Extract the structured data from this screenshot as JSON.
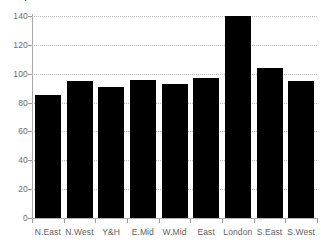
{
  "chart_data": {
    "type": "bar",
    "title": "",
    "xlabel": "",
    "ylabel": "",
    "categories": [
      "N.East",
      "N.West",
      "Y&H",
      "E.Mid",
      "W.Mid",
      "East",
      "London",
      "S.East",
      "S.West"
    ],
    "values": [
      85,
      95,
      91,
      96,
      93,
      97,
      140,
      104,
      95
    ],
    "ylim": [
      0,
      140
    ],
    "yticks": [
      0,
      20,
      40,
      60,
      80,
      100,
      120,
      140
    ],
    "ytick_labels": [
      "0",
      "20",
      "40",
      "60",
      "80",
      "100",
      "120",
      "140"
    ],
    "grid": true,
    "grid_style": "dotted",
    "legend": false,
    "bar_color": "#000000",
    "axis_color": "#a8a8a8",
    "grid_color": "#bcbcbc",
    "tick_label_color": "#6e6e6e"
  },
  "figure": {
    "background": "#ffffff",
    "clipped_title_fragment": "."
  }
}
